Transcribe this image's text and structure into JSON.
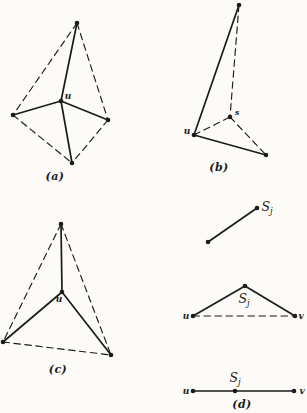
{
  "page": {
    "paper": "#fcfbf8",
    "ink": "#1b1b1b"
  },
  "shared": {
    "sj": {
      "base": "S",
      "sub": "j"
    }
  },
  "panels": {
    "a": {
      "caption": "(a)",
      "labels": {
        "u": "u"
      },
      "graph": {
        "vertices": {
          "top": [
            77,
            23
          ],
          "left": [
            13,
            115
          ],
          "right": [
            108,
            120
          ],
          "bottom": [
            72,
            163
          ],
          "u": [
            61,
            101
          ]
        },
        "edges": [
          [
            "u",
            "top",
            "solid"
          ],
          [
            "u",
            "left",
            "solid"
          ],
          [
            "u",
            "right",
            "solid"
          ],
          [
            "u",
            "bottom",
            "solid"
          ],
          [
            "top",
            "left",
            "dashed"
          ],
          [
            "top",
            "right",
            "dashed"
          ],
          [
            "left",
            "bottom",
            "dashed"
          ],
          [
            "right",
            "bottom",
            "dashed"
          ]
        ]
      }
    },
    "b": {
      "caption": "(b)",
      "labels": {
        "u": "u",
        "s": "s"
      },
      "graph": {
        "vertices": {
          "top": [
            239,
            5
          ],
          "s": [
            230,
            117
          ],
          "u": [
            194,
            135
          ],
          "br": [
            266,
            155
          ]
        },
        "edges": [
          [
            "u",
            "top",
            "solid"
          ],
          [
            "u",
            "br",
            "solid"
          ],
          [
            "top",
            "s",
            "dashed"
          ],
          [
            "u",
            "s",
            "dashed"
          ],
          [
            "s",
            "br",
            "dashed"
          ]
        ]
      }
    },
    "c": {
      "caption": "(c)",
      "labels": {
        "u": "u"
      },
      "graph": {
        "vertices": {
          "top": [
            61,
            224
          ],
          "u": [
            62,
            292
          ],
          "bl": [
            3,
            342
          ],
          "br": [
            111,
            355
          ]
        },
        "edges": [
          [
            "u",
            "top",
            "solid"
          ],
          [
            "u",
            "bl",
            "solid"
          ],
          [
            "u",
            "br",
            "solid"
          ],
          [
            "top",
            "bl",
            "dashed"
          ],
          [
            "top",
            "br",
            "dashed"
          ],
          [
            "bl",
            "br",
            "dashed"
          ]
        ]
      }
    },
    "d": {
      "caption": "(d)",
      "labels": {
        "u": "u",
        "v": "v"
      },
      "graph": {
        "vertices": {
          "p1": [
            208,
            242
          ],
          "p2": [
            257,
            208
          ],
          "apex": [
            245,
            286
          ],
          "u2": [
            193,
            316
          ],
          "v2": [
            295,
            316
          ],
          "u3": [
            193,
            391
          ],
          "m3": [
            235,
            391
          ],
          "v3": [
            294,
            391
          ]
        },
        "edges": [
          [
            "p1",
            "p2",
            "solid"
          ],
          [
            "apex",
            "u2",
            "solid"
          ],
          [
            "apex",
            "v2",
            "solid"
          ],
          [
            "u2",
            "v2",
            "dashed"
          ],
          [
            "u3",
            "m3",
            "solid"
          ],
          [
            "m3",
            "v3",
            "solid"
          ]
        ]
      }
    }
  }
}
